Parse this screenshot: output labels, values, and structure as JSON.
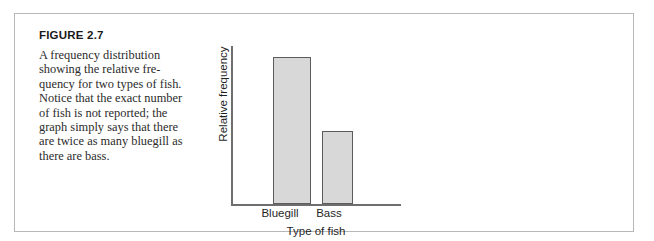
{
  "figure": {
    "label": "FIGURE 2.7",
    "caption": "A frequency distribution showing the relative fre-quency for two types of fish. Notice that the exact number of fish is not reported; the graph simply says that there are twice as many bluegill as there are bass.",
    "border_color": "#b8b8b8",
    "background_color": "#ffffff"
  },
  "chart_data": {
    "type": "bar",
    "title": "",
    "subtitle": "",
    "categories": [
      "Bluegill",
      "Bass"
    ],
    "values": [
      2,
      1
    ],
    "series": [
      {
        "name": "Relative frequency",
        "values": [
          2,
          1
        ]
      }
    ],
    "xlabel": "Type of fish",
    "ylabel": "Relative frequency",
    "ylim": [
      0,
      2.15
    ],
    "ytick_labels": [],
    "xtick_labels": [
      "Bluegill",
      "Bass"
    ],
    "grid": false,
    "legend": false,
    "legend_position": "none",
    "bar_fill_color": "#d8d8d8",
    "bar_border_color": "#5c5c5c",
    "axis_color": "#6e6e6e",
    "annotation": "The bluegill bar is twice the height of the bass bar; no numeric frequency scale is shown on the vertical axis."
  }
}
